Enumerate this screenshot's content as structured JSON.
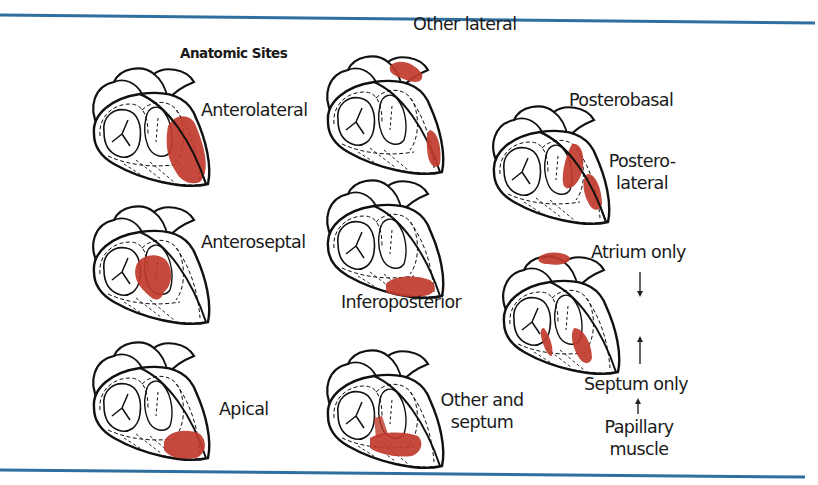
{
  "title": "Anatomic Sites",
  "colors": {
    "rule": "#2f6f9f",
    "infarct": "#c0392b",
    "outline": "#111111",
    "text": "#1a1a1a"
  },
  "hearts": [
    {
      "id": "anterolateral",
      "label": "Anterolateral",
      "infarct_regions": [
        "lateral-anterior wall"
      ]
    },
    {
      "id": "other-lateral",
      "label": "Other lateral",
      "infarct_regions": [
        "high lateral base",
        "low lateral wall"
      ]
    },
    {
      "id": "posterobasal",
      "label": "Posterobasal",
      "infarct_regions": [
        "posterobasal wall"
      ]
    },
    {
      "id": "posterolateral",
      "label": "Postero-lateral",
      "label_lines": [
        "Postero-",
        "lateral"
      ],
      "infarct_regions": [
        "posterolateral wall"
      ]
    },
    {
      "id": "anteroseptal",
      "label": "Anteroseptal",
      "infarct_regions": [
        "anterior septum"
      ]
    },
    {
      "id": "inferoposterior",
      "label": "Inferoposterior",
      "infarct_regions": [
        "inferior apex base"
      ]
    },
    {
      "id": "apical",
      "label": "Apical",
      "infarct_regions": [
        "apex"
      ]
    },
    {
      "id": "other-and-septum",
      "label": "Other and septum",
      "label_lines": [
        "Other and",
        "septum"
      ],
      "infarct_regions": [
        "septum",
        "inferior wall"
      ]
    },
    {
      "id": "atrium-septum-papillary",
      "labels": [
        "Atrium only",
        "Septum only",
        "Papillary muscle"
      ],
      "papillary_lines": [
        "Papillary",
        "muscle"
      ],
      "infarct_regions": [
        "atrium",
        "septum",
        "papillary muscle"
      ]
    }
  ],
  "arrows": [
    {
      "from": "Atrium only",
      "direction": "down"
    },
    {
      "from": "Septum only",
      "direction": "up"
    },
    {
      "from": "Papillary muscle",
      "direction": "up"
    }
  ]
}
